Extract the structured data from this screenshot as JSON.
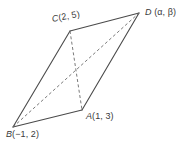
{
  "figure": {
    "name": "parallelogram-with-diagonals",
    "background_color": "#ffffff",
    "stroke_color": "#4a4a4a",
    "dashed_stroke_color": "#6b6b6b",
    "width": 183,
    "height": 146
  },
  "vertices": [
    {
      "id": "C",
      "label": "C(2, 5)",
      "point_letter": "C",
      "coords_text": "(2, 5)",
      "x": 70,
      "y": 31
    },
    {
      "id": "D",
      "label": "D (α, β)",
      "point_letter": "D",
      "coords_text": "(α, β)",
      "x": 139,
      "y": 13
    },
    {
      "id": "A",
      "label": "A(1, 3)",
      "point_letter": "A",
      "coords_text": "(1, 3)",
      "x": 82,
      "y": 110
    },
    {
      "id": "B",
      "label": "B(−1, 2)",
      "point_letter": "B",
      "coords_text": "(−1, 2)",
      "x": 13,
      "y": 127
    }
  ],
  "edges": [
    {
      "name": "edge-B-C",
      "from": "B",
      "to": "C",
      "style": "solid"
    },
    {
      "name": "edge-C-D",
      "from": "C",
      "to": "D",
      "style": "solid"
    },
    {
      "name": "edge-D-A",
      "from": "D",
      "to": "A",
      "style": "solid"
    },
    {
      "name": "edge-A-B",
      "from": "A",
      "to": "B",
      "style": "solid"
    }
  ],
  "diagonals": [
    {
      "name": "diagonal-B-D",
      "from": "B",
      "to": "D",
      "style": "dashed"
    },
    {
      "name": "diagonal-C-A",
      "from": "C",
      "to": "A",
      "style": "dashed"
    }
  ]
}
